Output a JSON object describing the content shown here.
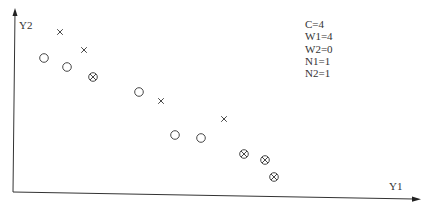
{
  "chart_data": {
    "type": "scatter",
    "title": "",
    "xlabel": "Y1",
    "ylabel": "Y2",
    "grid": false,
    "legend": null,
    "annotations": [
      "C=4",
      "W1=4",
      "W2=0",
      "N1=1",
      "N2=1"
    ],
    "series": [
      {
        "name": "circle",
        "marker": "circle",
        "points": [
          [
            44,
            58
          ],
          [
            67,
            67
          ],
          [
            139,
            92
          ],
          [
            175,
            135
          ],
          [
            201,
            138
          ]
        ]
      },
      {
        "name": "cross",
        "marker": "x",
        "points": [
          [
            60,
            32
          ],
          [
            84,
            50
          ],
          [
            161,
            101
          ],
          [
            224,
            119
          ]
        ]
      },
      {
        "name": "circled-cross",
        "marker": "otimes",
        "points": [
          [
            93,
            77
          ],
          [
            244,
            154
          ],
          [
            265,
            160
          ],
          [
            274,
            177
          ]
        ]
      }
    ]
  },
  "axes": {
    "x_label": "Y1",
    "y_label": "Y2"
  },
  "params": {
    "c": "C=4",
    "w1": "W1=4",
    "w2": "W2=0",
    "n1": "N1=1",
    "n2": "N2=1"
  },
  "colors": {
    "ink": "#333333",
    "background": "#ffffff"
  }
}
